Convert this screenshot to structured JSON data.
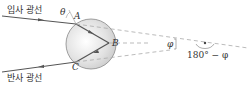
{
  "labels": {
    "incident_ray": "입사 광선",
    "reflected_ray": "반사 광선",
    "theta": "θ",
    "point_a": "A",
    "point_b": "B",
    "point_c": "C",
    "phi": "φ",
    "supplement": "180° − φ"
  },
  "colors": {
    "ray": "#555555",
    "dashed": "#aaaaaa",
    "sphere_fill": "#e4e4e4",
    "sphere_stroke": "#888888"
  }
}
